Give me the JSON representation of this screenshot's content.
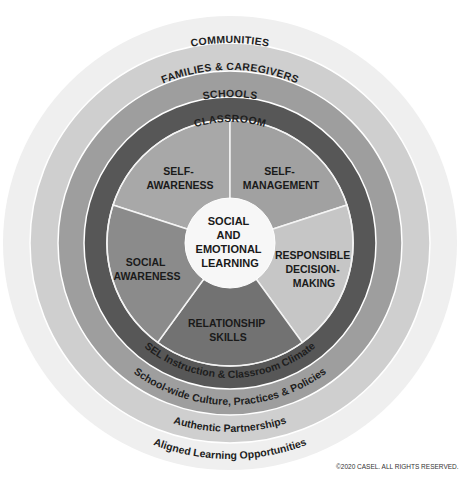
{
  "diagram": {
    "center": {
      "lines": [
        "SOCIAL",
        "AND",
        "EMOTIONAL",
        "LEARNING"
      ]
    },
    "competencies": [
      {
        "lines": [
          "SELF-",
          "AWARENESS"
        ],
        "color": "#a8a8a8"
      },
      {
        "lines": [
          "SELF-",
          "MANAGEMENT"
        ],
        "color": "#a1a1a1"
      },
      {
        "lines": [
          "RESPONSIBLE",
          "DECISION-",
          "MAKING"
        ],
        "color": "#c6c6c6"
      },
      {
        "lines": [
          "RELATIONSHIP",
          "SKILLS"
        ],
        "color": "#727272"
      },
      {
        "lines": [
          "SOCIAL",
          "AWARENESS"
        ],
        "color": "#8b8b8b"
      }
    ],
    "rings": [
      {
        "name": "CLASSROOM",
        "bottom_label": "SEL Instruction & Classroom Climate",
        "color": "#575757"
      },
      {
        "name": "SCHOOLS",
        "bottom_label": "School-wide Culture, Practices & Policies",
        "color": "#9e9e9e"
      },
      {
        "name": "FAMILIES & CAREGIVERS",
        "bottom_label": "Authentic Partnerships",
        "color": "#cfcfcf"
      },
      {
        "name": "COMMUNITIES",
        "bottom_label": "Aligned Learning Opportunities",
        "color": "#efefef"
      }
    ],
    "copyright": "©2020 CASEL. ALL RIGHTS RESERVED."
  }
}
